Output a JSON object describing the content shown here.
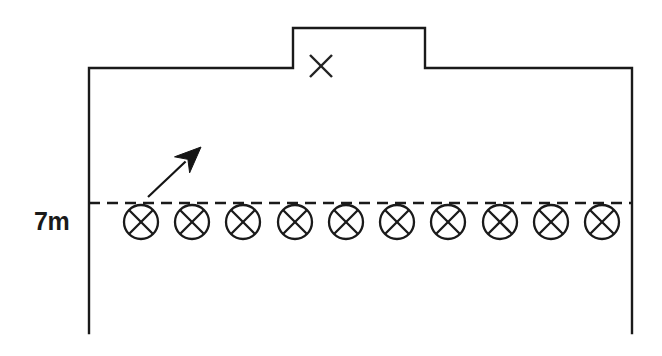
{
  "diagram": {
    "background_color": "#ffffff",
    "line_color": "#1a1a1a",
    "width": 662,
    "height": 356
  },
  "labels": {
    "height_label": "7m"
  },
  "enclosure": {
    "name": "outer-boundary",
    "left_wall_x": 89,
    "right_wall_x": 632,
    "top_y": 68,
    "bottom_y": 333,
    "notch": {
      "name": "top-notch",
      "left_x": 293,
      "right_x": 425,
      "top_y": 28
    }
  },
  "notch_marker": {
    "name": "x-marker",
    "symbol": "X",
    "center_x": 321,
    "center_y": 66,
    "size": 22
  },
  "reference_line": {
    "name": "dashed-reference-line",
    "y": 203,
    "x_start": 89,
    "x_end": 632,
    "style": "dashed",
    "dash": "11 7"
  },
  "conductors": {
    "name": "conductor-row",
    "count": 10,
    "symbol": "circle-with-cross",
    "radius": 17,
    "center_y": 222,
    "first_center_x": 141,
    "spacing": 51.2,
    "items": [
      {
        "index": 1,
        "cx": 141,
        "cy": 222
      },
      {
        "index": 2,
        "cx": 192,
        "cy": 222
      },
      {
        "index": 3,
        "cx": 243,
        "cy": 222
      },
      {
        "index": 4,
        "cx": 295,
        "cy": 222
      },
      {
        "index": 5,
        "cx": 346,
        "cy": 222
      },
      {
        "index": 6,
        "cx": 397,
        "cy": 222
      },
      {
        "index": 7,
        "cx": 448,
        "cy": 222
      },
      {
        "index": 8,
        "cx": 500,
        "cy": 222
      },
      {
        "index": 9,
        "cx": 551,
        "cy": 222
      },
      {
        "index": 10,
        "cx": 602,
        "cy": 222
      }
    ]
  },
  "arrow": {
    "name": "direction-arrow",
    "tail_x": 148,
    "tail_y": 197,
    "tip_x": 201,
    "tip_y": 147,
    "direction": "up-right"
  },
  "height_label_position": {
    "x": 34,
    "y": 230
  }
}
